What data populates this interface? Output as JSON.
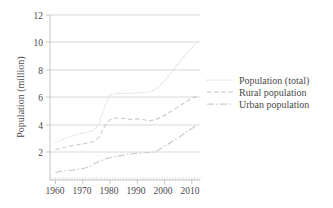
{
  "chart_data": {
    "type": "line",
    "title": "",
    "xlabel": "",
    "ylabel": "Population (million)",
    "xlim": [
      1958,
      2013
    ],
    "ylim": [
      0,
      12
    ],
    "yticks": [
      2,
      4,
      6,
      8,
      10,
      12
    ],
    "xticks": [
      1960,
      1970,
      1980,
      1990,
      2000,
      2010
    ],
    "ytick_labels": [
      "2",
      "4",
      "6",
      "8",
      "10",
      "12"
    ],
    "xtick_labels": [
      "1960",
      "1970",
      "1980",
      "1990",
      "2000",
      "2010"
    ],
    "grid": "horizontal",
    "legend_position": "right",
    "minor_ticks_x": true,
    "x": [
      1960,
      1962,
      1964,
      1966,
      1968,
      1970,
      1972,
      1974,
      1976,
      1978,
      1980,
      1982,
      1984,
      1986,
      1988,
      1990,
      1992,
      1994,
      1996,
      1998,
      2000,
      2002,
      2004,
      2006,
      2008,
      2010,
      2012
    ],
    "series": [
      {
        "name": "Population (total)",
        "style": "dotted",
        "values": [
          2.75,
          2.9,
          3.05,
          3.2,
          3.3,
          3.42,
          3.5,
          3.62,
          4.1,
          5.3,
          6.2,
          6.3,
          6.3,
          6.3,
          6.3,
          6.35,
          6.35,
          6.4,
          6.5,
          6.8,
          7.2,
          7.7,
          8.2,
          8.7,
          9.2,
          9.6,
          10.05
        ]
      },
      {
        "name": "Rural population",
        "style": "dashed",
        "values": [
          2.2,
          2.3,
          2.4,
          2.5,
          2.55,
          2.62,
          2.7,
          2.8,
          3.1,
          3.9,
          4.4,
          4.5,
          4.5,
          4.45,
          4.4,
          4.45,
          4.4,
          4.3,
          4.35,
          4.5,
          4.7,
          4.95,
          5.2,
          5.45,
          5.7,
          5.95,
          6.1
        ]
      },
      {
        "name": "Urban population",
        "style": "dash-dot",
        "values": [
          0.55,
          0.62,
          0.68,
          0.72,
          0.78,
          0.82,
          0.95,
          1.15,
          1.35,
          1.5,
          1.62,
          1.7,
          1.78,
          1.85,
          1.9,
          1.95,
          1.98,
          2.0,
          2.02,
          2.2,
          2.45,
          2.7,
          2.95,
          3.2,
          3.5,
          3.75,
          4.0
        ]
      }
    ]
  },
  "legend": {
    "entries": [
      {
        "label": "Population (total)"
      },
      {
        "label": "Rural population"
      },
      {
        "label": "Urban population"
      }
    ]
  }
}
